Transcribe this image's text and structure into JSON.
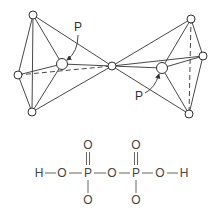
{
  "diagram": {
    "structure": {
      "labels": [
        {
          "id": "p_left_label",
          "text": "P",
          "x": 78,
          "y": 31
        },
        {
          "id": "p_right_label",
          "text": "P",
          "x": 139,
          "y": 100
        }
      ]
    },
    "formula": {
      "atoms": [
        {
          "id": "h1",
          "text": "H",
          "x": 39,
          "y": 177
        },
        {
          "id": "o1",
          "text": "O",
          "x": 62,
          "y": 177
        },
        {
          "id": "p1",
          "text": "P",
          "x": 88,
          "y": 177
        },
        {
          "id": "o_bridge",
          "text": "O",
          "x": 112,
          "y": 177
        },
        {
          "id": "p2",
          "text": "P",
          "x": 136,
          "y": 177
        },
        {
          "id": "o4",
          "text": "O",
          "x": 160,
          "y": 177
        },
        {
          "id": "h2",
          "text": "H",
          "x": 184,
          "y": 177
        },
        {
          "id": "o_top1",
          "text": "O",
          "x": 88,
          "y": 149
        },
        {
          "id": "o_top2",
          "text": "O",
          "x": 136,
          "y": 149
        },
        {
          "id": "o_bot1",
          "text": "O",
          "x": 88,
          "y": 204
        },
        {
          "id": "o_bot2",
          "text": "O",
          "x": 136,
          "y": 204
        }
      ]
    }
  }
}
